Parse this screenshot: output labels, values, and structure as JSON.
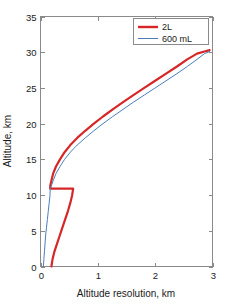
{
  "chart_data": {
    "type": "line",
    "title": "",
    "xlabel": "Altitude resolution, km",
    "ylabel": "Altitude, km",
    "xlim": [
      0,
      3
    ],
    "ylim": [
      0,
      35
    ],
    "xticks": [
      "0",
      "1",
      "2",
      "3"
    ],
    "yticks": [
      "0",
      "5",
      "10",
      "15",
      "20",
      "25",
      "30",
      "35"
    ],
    "xtick_values": [
      0,
      1,
      2,
      3
    ],
    "ytick_values": [
      0,
      5,
      10,
      15,
      20,
      25,
      30,
      35
    ],
    "grid": false,
    "legend_position": "upper right",
    "series": [
      {
        "name": "2L",
        "color": "#D62728",
        "linewidth": 2.2,
        "x": [
          0.19,
          0.21,
          0.24,
          0.28,
          0.33,
          0.38,
          0.43,
          0.48,
          0.52,
          0.55,
          0.57,
          0.17,
          0.17,
          0.19,
          0.22,
          0.27,
          0.34,
          0.42,
          0.52,
          0.64,
          0.78,
          0.93,
          1.09,
          1.26,
          1.44,
          1.62,
          1.81,
          2.0,
          2.19,
          2.38,
          2.56,
          2.73,
          2.86,
          2.95
        ],
        "y": [
          0.0,
          1.0,
          2.0,
          3.0,
          4.2,
          5.4,
          6.6,
          7.8,
          8.9,
          9.9,
          10.9,
          10.9,
          11.3,
          12.0,
          13.0,
          14.0,
          15.0,
          16.0,
          17.0,
          18.0,
          19.0,
          20.0,
          21.0,
          22.0,
          23.0,
          24.0,
          25.0,
          26.0,
          27.0,
          28.0,
          29.0,
          29.8,
          30.1,
          30.3
        ]
      },
      {
        "name": "600 mL",
        "color": "#4A7EBB",
        "linewidth": 1.0,
        "x": [
          0.05,
          0.06,
          0.07,
          0.08,
          0.09,
          0.105,
          0.12,
          0.135,
          0.15,
          0.165,
          0.17,
          0.19,
          0.22,
          0.27,
          0.34,
          0.42,
          0.52,
          0.64,
          0.78,
          0.93,
          1.09,
          1.26,
          1.44,
          1.62,
          1.81,
          2.0,
          2.19,
          2.38,
          2.56,
          2.73,
          2.86,
          2.95
        ],
        "y": [
          0.0,
          1.1,
          2.2,
          3.3,
          4.4,
          5.5,
          6.6,
          7.7,
          8.8,
          9.9,
          10.9,
          11.3,
          12.0,
          13.0,
          14.0,
          15.0,
          16.0,
          17.0,
          18.0,
          19.0,
          20.0,
          21.0,
          22.0,
          23.0,
          24.0,
          25.0,
          26.0,
          27.0,
          28.0,
          29.0,
          29.8,
          30.1
        ]
      }
    ],
    "legend": [
      {
        "label": "2L",
        "color": "#D62728",
        "linewidth": 2.4
      },
      {
        "label": "600 mL",
        "color": "#4A7EBB",
        "linewidth": 1.0
      }
    ]
  },
  "colors": {
    "axis": "#8a8a8a",
    "text": "#1a1a1a",
    "background": "#ffffff",
    "series_2l": "#D62728",
    "series_600ml": "#4A7EBB"
  }
}
